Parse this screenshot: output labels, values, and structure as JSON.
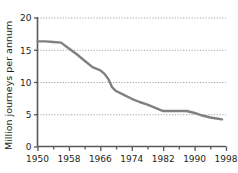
{
  "chart_data": {
    "type": "line",
    "title": "",
    "xlabel": "",
    "ylabel": "Million journeys per annum",
    "xlim": [
      1950,
      1998
    ],
    "ylim": [
      0,
      20
    ],
    "yticks": [
      0,
      5,
      10,
      15,
      20
    ],
    "ytick_labels": [
      "0",
      "5",
      "10",
      "15",
      "20"
    ],
    "xticks": [
      1950,
      1958,
      1966,
      1974,
      1982,
      1990,
      1998
    ],
    "xtick_labels": [
      "1950",
      "1958",
      "1966",
      "1974",
      "1982",
      "1990",
      "1998"
    ],
    "x_minor_tick_interval": 4,
    "grid": "horizontal-dotted",
    "legend": "none",
    "line_color": "#808080",
    "grid_color": "#999999",
    "axis_color": "#58595b",
    "series": [
      {
        "name": "Million journeys per annum",
        "x": [
          1950,
          1952,
          1954,
          1956,
          1958,
          1960,
          1962,
          1964,
          1966,
          1967,
          1968,
          1969,
          1970,
          1972,
          1974,
          1976,
          1978,
          1980,
          1982,
          1984,
          1986,
          1988,
          1990,
          1992,
          1994,
          1996,
          1997
        ],
        "values": [
          16.3,
          16.3,
          16.2,
          16.1,
          15.2,
          14.3,
          13.3,
          12.3,
          11.8,
          11.3,
          10.5,
          9.2,
          8.6,
          8.0,
          7.4,
          6.9,
          6.5,
          6.0,
          5.5,
          5.5,
          5.5,
          5.5,
          5.2,
          4.8,
          4.5,
          4.3,
          4.2
        ]
      }
    ]
  },
  "axes": {
    "ylabel_text": "Million journeys per annum"
  }
}
